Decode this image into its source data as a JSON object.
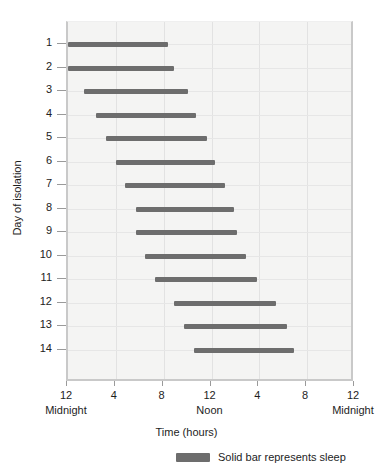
{
  "chart_data": {
    "type": "bar",
    "title": "",
    "subtitle": "",
    "xlabel": "Time (hours)",
    "ylabel": "Day of isolation",
    "xlim": [
      0,
      24
    ],
    "ylim": [
      0,
      15
    ],
    "grid": true,
    "orientation": "horizontal",
    "x_ticks": [
      {
        "value": 0,
        "label": "12",
        "sublabel": "Midnight"
      },
      {
        "value": 4,
        "label": "4",
        "sublabel": ""
      },
      {
        "value": 8,
        "label": "8",
        "sublabel": ""
      },
      {
        "value": 12,
        "label": "12",
        "sublabel": "Noon"
      },
      {
        "value": 16,
        "label": "4",
        "sublabel": ""
      },
      {
        "value": 20,
        "label": "8",
        "sublabel": ""
      },
      {
        "value": 24,
        "label": "12",
        "sublabel": "Midnight"
      }
    ],
    "categories": [
      "1",
      "2",
      "3",
      "4",
      "5",
      "6",
      "7",
      "8",
      "9",
      "10",
      "11",
      "12",
      "13",
      "14"
    ],
    "bars": [
      {
        "day": "1",
        "start": 0.0,
        "end": 8.4
      },
      {
        "day": "2",
        "start": 0.0,
        "end": 8.9
      },
      {
        "day": "3",
        "start": 1.3,
        "end": 10.0
      },
      {
        "day": "4",
        "start": 2.3,
        "end": 10.7
      },
      {
        "day": "5",
        "start": 3.2,
        "end": 11.6
      },
      {
        "day": "6",
        "start": 4.0,
        "end": 12.3
      },
      {
        "day": "7",
        "start": 4.8,
        "end": 13.1
      },
      {
        "day": "8",
        "start": 5.7,
        "end": 13.9
      },
      {
        "day": "9",
        "start": 5.7,
        "end": 14.1
      },
      {
        "day": "10",
        "start": 6.4,
        "end": 14.9
      },
      {
        "day": "11",
        "start": 7.3,
        "end": 15.8
      },
      {
        "day": "12",
        "start": 8.9,
        "end": 17.4
      },
      {
        "day": "13",
        "start": 9.7,
        "end": 18.3
      },
      {
        "day": "14",
        "start": 10.5,
        "end": 18.9
      }
    ],
    "legend": {
      "position": "bottom",
      "entries": [
        {
          "label": "Solid bar represents sleep",
          "color": "#6d6d6d"
        }
      ]
    },
    "colors": {
      "bar": "#6d6d6d",
      "plot_background": "#f4f4f3",
      "gridline": "#e2e2e2",
      "axis": "#c9c9c9",
      "text": "#1d1d1d"
    }
  }
}
